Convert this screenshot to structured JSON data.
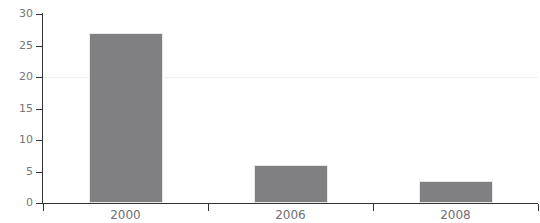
{
  "chart_data": {
    "type": "bar",
    "title": "",
    "xlabel": "",
    "ylabel": "",
    "categories": [
      "2000",
      "2006",
      "2008"
    ],
    "values": [
      27,
      6,
      3.5
    ],
    "series": [
      {
        "name": "value",
        "values": [
          27,
          6,
          3.5
        ]
      }
    ],
    "ylim": [
      0,
      30
    ],
    "yticks": [
      0,
      5,
      10,
      15,
      20,
      25,
      30
    ],
    "ytick_labels": [
      "0",
      "5",
      "10",
      "15",
      "20",
      "25",
      "30"
    ],
    "xtick_labels": [
      "2000",
      "2006",
      "2008"
    ],
    "grid": "horizontal-faint-at-20",
    "gridlines": [
      20
    ],
    "legend": "none",
    "bar_color": "#808083",
    "axis_color": "#333336",
    "tick_label_color": "#75757a",
    "gridline_color": "#f2f0f2",
    "background_color": "#ffffff"
  },
  "figure": {
    "cropped_title": ""
  }
}
